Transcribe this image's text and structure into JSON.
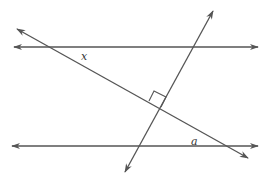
{
  "diagram": {
    "type": "geometry",
    "colors": {
      "line": "#555555",
      "label": "#333333",
      "background": "#ffffff"
    },
    "lines": [
      {
        "id": "parallel-top",
        "x1": 14,
        "y1": 47,
        "x2": 258,
        "y2": 47,
        "arrows": "both"
      },
      {
        "id": "parallel-bottom",
        "x1": 12,
        "y1": 146,
        "x2": 258,
        "y2": 146,
        "arrows": "both"
      },
      {
        "id": "transversal-falling",
        "x1": 17,
        "y1": 29,
        "x2": 248,
        "y2": 158,
        "arrows": "both"
      },
      {
        "id": "transversal-rising",
        "x1": 213,
        "y1": 11,
        "x2": 125,
        "y2": 172,
        "arrows": "both"
      }
    ],
    "right_angle_mark": {
      "points": "149,101 154,91 166,97 161,107"
    },
    "labels": [
      {
        "id": "angle-x",
        "text": "x",
        "x": 81,
        "y": 60
      },
      {
        "id": "angle-a",
        "text": "a",
        "x": 191,
        "y": 145
      }
    ]
  }
}
